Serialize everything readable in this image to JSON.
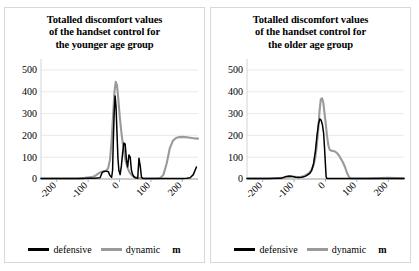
{
  "figure": {
    "background": "#ffffff",
    "panel_border": "#d8d8d8"
  },
  "legend": {
    "defensive_label": "defensive",
    "dynamic_label": "dynamic",
    "axis_unit": "m",
    "defensive_color": "#000000",
    "dynamic_color": "#9a9a9a"
  },
  "chart_data": [
    {
      "type": "line",
      "title": "Totalled discomfort values of the handset control for the younger age group",
      "title_lines": [
        "Totalled discomfort values",
        "of the handset control for",
        "the younger age group"
      ],
      "xlabel": "m",
      "ylabel": "",
      "xlim": [
        -250,
        250
      ],
      "ylim": [
        0,
        550
      ],
      "xticks": [
        -200,
        -100,
        0,
        100,
        200
      ],
      "xticklabels": [
        "-200",
        "-100",
        "0",
        "100",
        "200"
      ],
      "yticks": [
        0,
        100,
        200,
        300,
        400,
        500
      ],
      "yticklabels": [
        "0",
        "100",
        "200",
        "300",
        "400",
        "500"
      ],
      "grid": true,
      "grid_color": "#e4e4e4",
      "legend_position": "below",
      "series": [
        {
          "name": "defensive",
          "color": "#000000",
          "x": [
            -250,
            -200,
            -160,
            -120,
            -100,
            -80,
            -70,
            -62,
            -55,
            -50,
            -45,
            -42,
            -38,
            -35,
            -32,
            -28,
            -25,
            -22,
            -20,
            -17,
            -14,
            -11,
            -8,
            -5,
            -2,
            2,
            6,
            10,
            14,
            18,
            22,
            26,
            30,
            34,
            38,
            42,
            46,
            50,
            54,
            58,
            62,
            66,
            70,
            74,
            78,
            82,
            86,
            90,
            100,
            120,
            150,
            180,
            200,
            215,
            225,
            235,
            245
          ],
          "values": [
            2,
            2,
            2,
            2,
            3,
            4,
            5,
            6,
            30,
            34,
            35,
            35,
            34,
            33,
            20,
            12,
            8,
            40,
            160,
            300,
            380,
            330,
            210,
            95,
            40,
            20,
            60,
            120,
            165,
            160,
            90,
            55,
            110,
            100,
            40,
            20,
            10,
            6,
            4,
            3,
            95,
            60,
            8,
            3,
            2,
            2,
            2,
            2,
            2,
            2,
            2,
            2,
            2,
            3,
            6,
            20,
            55
          ]
        },
        {
          "name": "dynamic",
          "color": "#9a9a9a",
          "x": [
            -250,
            -200,
            -160,
            -130,
            -110,
            -95,
            -85,
            -78,
            -70,
            -62,
            -55,
            -48,
            -42,
            -36,
            -30,
            -25,
            -20,
            -16,
            -12,
            -8,
            -4,
            0,
            4,
            8,
            12,
            16,
            20,
            26,
            32,
            40,
            50,
            60,
            70,
            80,
            90,
            100,
            110,
            120,
            130,
            140,
            150,
            160,
            170,
            180,
            190,
            200,
            210,
            220,
            230,
            240,
            250
          ],
          "values": [
            2,
            2,
            2,
            3,
            5,
            8,
            10,
            14,
            22,
            30,
            34,
            36,
            38,
            50,
            90,
            180,
            300,
            400,
            445,
            430,
            370,
            300,
            240,
            190,
            150,
            110,
            80,
            50,
            30,
            16,
            8,
            4,
            3,
            2,
            2,
            2,
            2,
            2,
            4,
            20,
            70,
            140,
            175,
            188,
            192,
            193,
            192,
            190,
            188,
            186,
            185
          ]
        }
      ]
    },
    {
      "type": "line",
      "title": "Totalled discomfort values of the handset control for the older age group",
      "title_lines": [
        "Totalled discomfort values",
        "of the handset control for",
        "the older age group"
      ],
      "xlabel": "m",
      "ylabel": "",
      "xlim": [
        -250,
        250
      ],
      "ylim": [
        0,
        550
      ],
      "xticks": [
        -200,
        -100,
        0,
        100,
        200
      ],
      "xticklabels": [
        "-200",
        "-100",
        "0",
        "100",
        "200"
      ],
      "yticks": [
        0,
        100,
        200,
        300,
        400,
        500
      ],
      "yticklabels": [
        "0",
        "100",
        "200",
        "300",
        "400",
        "500"
      ],
      "grid": true,
      "grid_color": "#e4e4e4",
      "legend_position": "below",
      "series": [
        {
          "name": "defensive",
          "color": "#000000",
          "x": [
            -250,
            -210,
            -180,
            -160,
            -140,
            -125,
            -115,
            -105,
            -95,
            -85,
            -75,
            -65,
            -58,
            -50,
            -44,
            -38,
            -32,
            -27,
            -22,
            -18,
            -14,
            -10,
            -6,
            -3,
            0,
            2,
            4,
            6,
            8,
            20,
            60,
            100,
            140,
            180,
            220,
            250
          ],
          "values": [
            2,
            2,
            2,
            3,
            4,
            12,
            14,
            12,
            8,
            7,
            8,
            12,
            18,
            26,
            40,
            70,
            130,
            200,
            255,
            275,
            270,
            250,
            210,
            140,
            60,
            10,
            3,
            2,
            2,
            2,
            2,
            2,
            2,
            2,
            2,
            2
          ]
        },
        {
          "name": "dynamic",
          "color": "#9a9a9a",
          "x": [
            -250,
            -210,
            -180,
            -155,
            -135,
            -120,
            -108,
            -98,
            -88,
            -78,
            -68,
            -60,
            -52,
            -45,
            -39,
            -33,
            -28,
            -23,
            -19,
            -15,
            -11,
            -7,
            -3,
            1,
            5,
            9,
            13,
            18,
            24,
            30,
            36,
            42,
            48,
            55,
            62,
            68,
            74,
            78,
            82,
            86,
            95,
            110,
            130,
            150,
            175,
            200,
            225,
            250
          ],
          "values": [
            2,
            2,
            2,
            3,
            5,
            9,
            11,
            10,
            9,
            10,
            14,
            20,
            28,
            40,
            60,
            95,
            150,
            230,
            310,
            365,
            370,
            350,
            300,
            250,
            195,
            155,
            135,
            130,
            128,
            126,
            120,
            110,
            95,
            78,
            55,
            30,
            12,
            5,
            3,
            2,
            2,
            2,
            2,
            3,
            4,
            5,
            4,
            3
          ]
        }
      ]
    }
  ]
}
